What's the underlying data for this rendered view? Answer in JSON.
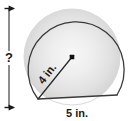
{
  "figure": {
    "shape_name": "circle-with-flat-bottom",
    "background_color": "#ffffff",
    "outline_color": "#333333",
    "fill_light": "#f2f2f2",
    "fill_mid": "#e2e2e2",
    "fill_dark": "#bdbdbd",
    "labels": {
      "radius": "4 in.",
      "chord": "5 in.",
      "height_unknown": "?"
    },
    "annotations": {
      "radius_label_rotation_deg": -52,
      "center_marker": "center-dot",
      "height_dimension_orientation": "vertical",
      "chord_dimension_orientation": "horizontal"
    },
    "geometry": {
      "center_x": 72,
      "center_y": 57,
      "circle_radius_px": 48,
      "chord_left_x": 38,
      "chord_left_y": 99,
      "chord_right_x": 117,
      "chord_right_y": 95,
      "dimension_line_x": 9,
      "dimension_top_y": 9,
      "dimension_bottom_y": 107
    }
  }
}
